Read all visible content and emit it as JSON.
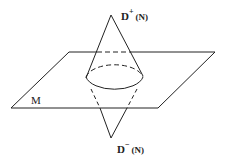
{
  "diagram": {
    "type": "light-cone-over-spacelike-hypersurface",
    "colors": {
      "stroke": "#222222",
      "background": "#ffffff"
    },
    "labels": {
      "future_domain": {
        "symbol": "D",
        "superscript": "+",
        "argument": "(N)"
      },
      "past_domain": {
        "symbol": "D",
        "superscript": "−",
        "argument": "(N)"
      },
      "surface": "M"
    },
    "shapes": {
      "top_apex": [
        111,
        15
      ],
      "bottom_apex": [
        111,
        138
      ],
      "plane_corners": [
        [
          69,
          52
        ],
        [
          215,
          52
        ],
        [
          158,
          108
        ],
        [
          11,
          108
        ]
      ],
      "ellipse": {
        "cx": 114,
        "cy": 77,
        "rx": 29,
        "ry": 15
      }
    }
  }
}
